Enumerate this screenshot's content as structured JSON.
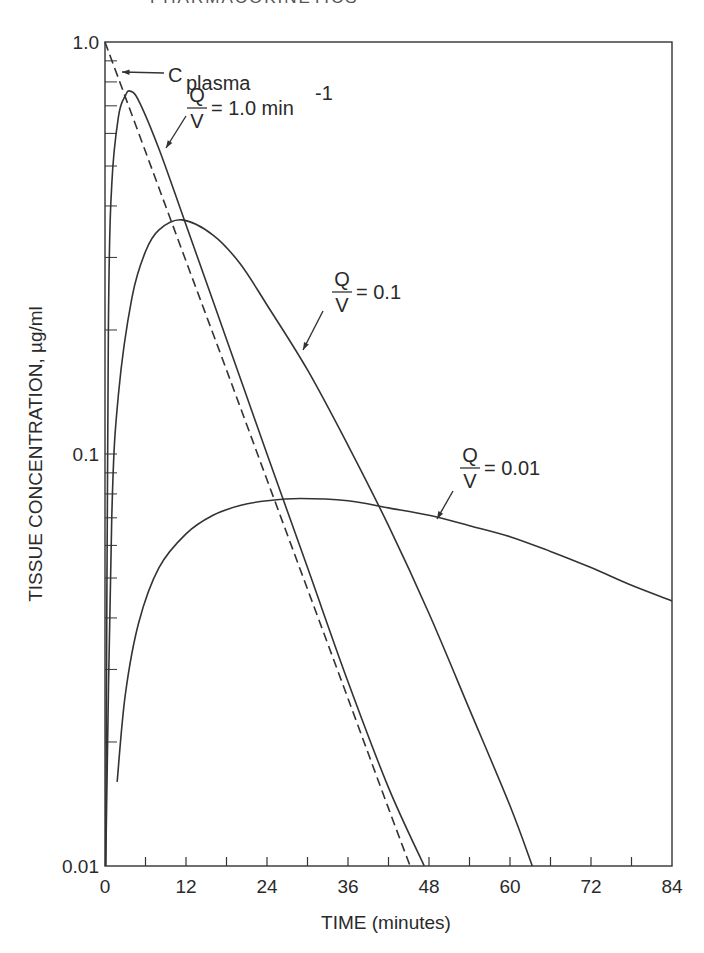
{
  "page": {
    "header_fragment": "PHARMACOKINETICS"
  },
  "chart_data": {
    "type": "line",
    "title": "",
    "xlabel": "TIME (minutes)",
    "ylabel": "TISSUE CONCENTRATION, µg/ml",
    "xlim": [
      0,
      84
    ],
    "ylim": [
      0.01,
      1.0
    ],
    "yscale": "log",
    "grid": false,
    "x_ticks": [
      0,
      12,
      24,
      36,
      48,
      60,
      72,
      84
    ],
    "x_tick_labels": [
      "0",
      "12",
      "24",
      "36",
      "48",
      "60",
      "72",
      "84"
    ],
    "y_tick_labels": [
      "1.0",
      "0.1",
      "0.01"
    ],
    "y_ticks": [
      1.0,
      0.1,
      0.01
    ],
    "series": [
      {
        "name": "C plasma",
        "style": "dashed",
        "x": [
          0,
          6,
          12,
          18,
          24,
          30,
          36,
          42,
          45.2
        ],
        "y": [
          1.0,
          0.542,
          0.294,
          0.16,
          0.0866,
          0.047,
          0.0255,
          0.0138,
          0.01
        ]
      },
      {
        "name": "Q/V = 1.0 min^-1",
        "style": "solid",
        "x": [
          0.1,
          0.5,
          1,
          2,
          3,
          3.7,
          5,
          8,
          12,
          18,
          24,
          30,
          36,
          42,
          47.3
        ],
        "y": [
          0.01,
          0.2,
          0.45,
          0.66,
          0.74,
          0.76,
          0.72,
          0.55,
          0.36,
          0.19,
          0.1,
          0.053,
          0.028,
          0.0155,
          0.01
        ]
      },
      {
        "name": "Q/V = 0.1",
        "style": "solid",
        "x": [
          0.1,
          1,
          2,
          4,
          6,
          8,
          11.4,
          16,
          20,
          24,
          30,
          36,
          42,
          48,
          54,
          60,
          63.3
        ],
        "y": [
          0.01,
          0.07,
          0.14,
          0.24,
          0.31,
          0.35,
          0.37,
          0.34,
          0.29,
          0.23,
          0.16,
          0.105,
          0.067,
          0.041,
          0.024,
          0.014,
          0.01
        ]
      },
      {
        "name": "Q/V = 0.01",
        "style": "solid",
        "x": [
          1.8,
          3,
          5,
          8,
          12,
          16,
          20,
          24,
          28.9,
          36,
          42,
          48,
          54,
          60,
          66,
          72,
          78,
          84
        ],
        "y": [
          0.016,
          0.026,
          0.039,
          0.053,
          0.064,
          0.071,
          0.075,
          0.077,
          0.078,
          0.077,
          0.074,
          0.071,
          0.067,
          0.063,
          0.058,
          0.053,
          0.048,
          0.044
        ]
      }
    ],
    "annotations": [
      {
        "text_main": "C",
        "text_sub": "plasma",
        "points_to": "C plasma"
      },
      {
        "numerator": "Q",
        "denominator": "V",
        "text": "= 1.0 min",
        "superscript": "-1",
        "points_to": "Q/V = 1.0 min^-1"
      },
      {
        "numerator": "Q",
        "denominator": "V",
        "text": "= 0.1",
        "points_to": "Q/V = 0.1"
      },
      {
        "numerator": "Q",
        "denominator": "V",
        "text": "= 0.01",
        "points_to": "Q/V = 0.01"
      }
    ]
  }
}
